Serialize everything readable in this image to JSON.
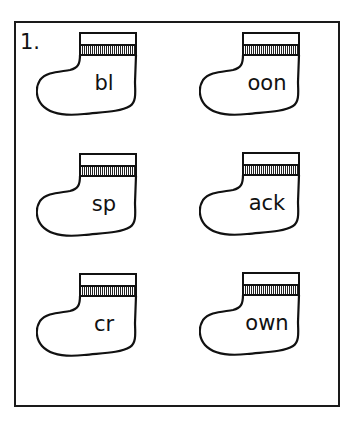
{
  "worksheet": {
    "item_number": "1.",
    "socks": [
      {
        "word": "bl",
        "position": "top-left"
      },
      {
        "word": "oon",
        "position": "top-right"
      },
      {
        "word": "sp",
        "position": "middle-left"
      },
      {
        "word": "ack",
        "position": "middle-right"
      },
      {
        "word": "cr",
        "position": "bottom-left"
      },
      {
        "word": "own",
        "position": "bottom-right"
      }
    ]
  },
  "colors": {
    "ink": "#111111",
    "paper": "#ffffff"
  }
}
